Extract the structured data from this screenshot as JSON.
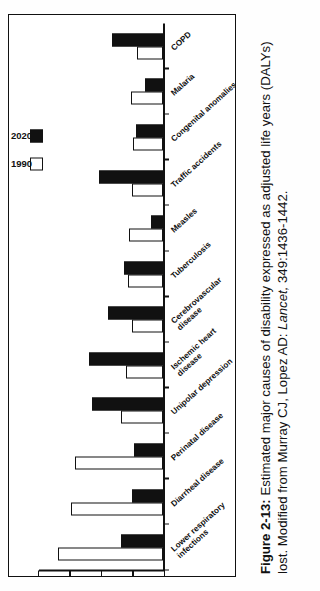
{
  "figure": {
    "caption_label": "Figure 2-13:",
    "caption_text": " Estimated major causes of disability expressed as adjusted life years (DALYs) lost. Modified from Murray CJ, Lopez AD: ",
    "caption_source_italic": "Lancet,",
    "caption_source_rest": " 349:1436-1442."
  },
  "legend": {
    "items": [
      {
        "label": "1990",
        "style": "open"
      },
      {
        "label": "2020",
        "style": "solid"
      }
    ]
  },
  "axis": {
    "ticks": [
      "0",
      "2.5",
      "5",
      "7.5",
      "10"
    ]
  },
  "chart_data": {
    "type": "bar",
    "title": "Estimated major causes of disability expressed as adjusted life years (DALYs) lost",
    "orientation": "vertical-bars-rotated-page",
    "xlabel": "",
    "ylabel": "",
    "ylim": [
      0,
      10
    ],
    "yticks": [
      0,
      2.5,
      5,
      7.5,
      10
    ],
    "grid": false,
    "legend_position": "top-left",
    "categories": [
      "Lower respiratory infections",
      "Diarrheal disease",
      "Perinatal disease",
      "Unipolar depression",
      "Ischemic heart disease",
      "Cerebrovascular disease",
      "Tuberculosis",
      "Measles",
      "Traffic accidents",
      "Congenital anomalies",
      "Malaria",
      "COPD"
    ],
    "category_lines": [
      [
        "Lower respiratory",
        "infections"
      ],
      [
        "Diarrheal disease"
      ],
      [
        "Perinatal disease"
      ],
      [
        "Unipolar depression"
      ],
      [
        "Ischemic heart",
        "disease"
      ],
      [
        "Cerebrovascular",
        "disease"
      ],
      [
        "Tuberculosis"
      ],
      [
        "Measles"
      ],
      [
        "Traffic accidents"
      ],
      [
        "Congenital anomalies"
      ],
      [
        "Malaria"
      ],
      [
        "COPD"
      ]
    ],
    "series": [
      {
        "name": "1990",
        "color": "#ffffff",
        "values": [
          8.4,
          7.3,
          7.0,
          3.4,
          3.0,
          2.5,
          2.8,
          2.7,
          2.5,
          2.4,
          2.6,
          2.1
        ]
      },
      {
        "name": "2020",
        "color": "#111111",
        "values": [
          3.4,
          2.5,
          2.3,
          5.7,
          5.9,
          4.4,
          3.1,
          1.0,
          5.1,
          2.2,
          1.5,
          4.1
        ]
      }
    ]
  }
}
